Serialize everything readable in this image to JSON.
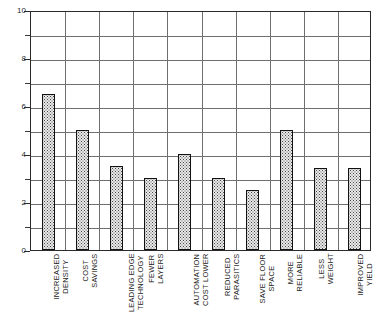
{
  "chart_data": {
    "type": "bar",
    "title": "",
    "subtitle": "",
    "xlabel": "",
    "ylabel": "",
    "ylim": [
      0,
      10
    ],
    "ytick_labels": [
      "0",
      "2",
      "4",
      "6",
      "8",
      "10"
    ],
    "ytick_values": [
      0,
      2,
      4,
      6,
      8,
      10
    ],
    "minor_gridline_values": [
      1,
      3,
      5,
      7,
      9
    ],
    "grid": "horizontal-and-vertical",
    "legend": "none",
    "categories": [
      "INCREASED DENSITY",
      "COST SAVINGS",
      "LEADING EDGE TECHNOLOGY",
      "FEWER LAYERS",
      "AUTOMATION COST LOWER",
      "REDUCED PARASITICS",
      "SAVE FLOOR SPACE",
      "MORE RELIABLE",
      "LESS WEIGHT",
      "IMPROVED YIELD"
    ],
    "category_lines": [
      [
        "INCREASED",
        "DENSITY"
      ],
      [
        "COST",
        "SAVINGS"
      ],
      [
        "LEADING EDGE",
        "TECHNOLOGY"
      ],
      [
        "FEWER",
        "LAYERS"
      ],
      [
        "AUTOMATION",
        "COST LOWER"
      ],
      [
        "REDUCED",
        "PARASITICS"
      ],
      [
        "SAVE FLOOR",
        "SPACE"
      ],
      [
        "MORE",
        "RELIABLE"
      ],
      [
        "LESS",
        "WEIGHT"
      ],
      [
        "IMPROVED",
        "YIELD"
      ]
    ],
    "values": [
      6.5,
      5.0,
      3.5,
      3.0,
      4.0,
      3.0,
      2.5,
      5.0,
      3.4,
      3.4
    ],
    "bar_fill": "#e8e8e8",
    "bar_border": "#111111",
    "grid_color": "#6f6f6f",
    "frame_color": "#2a2a2a",
    "background": "#ffffff"
  }
}
